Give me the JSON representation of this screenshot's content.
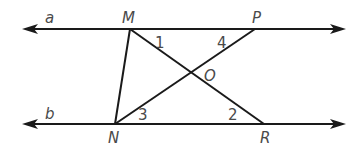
{
  "diagram": {
    "lines": [
      {
        "name": "a",
        "label": "a",
        "y": 29,
        "x_start": 22,
        "x_end": 345,
        "arrows": "both"
      },
      {
        "name": "b",
        "label": "b",
        "y": 124,
        "x_start": 22,
        "x_end": 345,
        "arrows": "both"
      }
    ],
    "points": {
      "M": {
        "label": "M",
        "x": 130,
        "y": 29
      },
      "P": {
        "label": "P",
        "x": 255,
        "y": 29
      },
      "N": {
        "label": "N",
        "x": 115,
        "y": 124
      },
      "R": {
        "label": "R",
        "x": 264,
        "y": 124
      },
      "O": {
        "label": "O",
        "x": 192,
        "y": 74
      }
    },
    "segments": [
      {
        "from": "M",
        "to": "N"
      },
      {
        "from": "M",
        "to": "R"
      },
      {
        "from": "N",
        "to": "P"
      }
    ],
    "angles": [
      {
        "label": "1",
        "position": "near M between line a and MR"
      },
      {
        "label": "4",
        "position": "near P between line a and PN"
      },
      {
        "label": "3",
        "position": "near N between line b and NP"
      },
      {
        "label": "2",
        "position": "near R between line b and RM"
      }
    ],
    "labels": {
      "line_a": "a",
      "line_b": "b",
      "point_M": "M",
      "point_P": "P",
      "point_N": "N",
      "point_R": "R",
      "point_O": "O",
      "angle_1": "1",
      "angle_2": "2",
      "angle_3": "3",
      "angle_4": "4"
    },
    "colors": {
      "line": "#1a1a1a",
      "label": "#4a4a4a",
      "background": "#ffffff"
    }
  }
}
